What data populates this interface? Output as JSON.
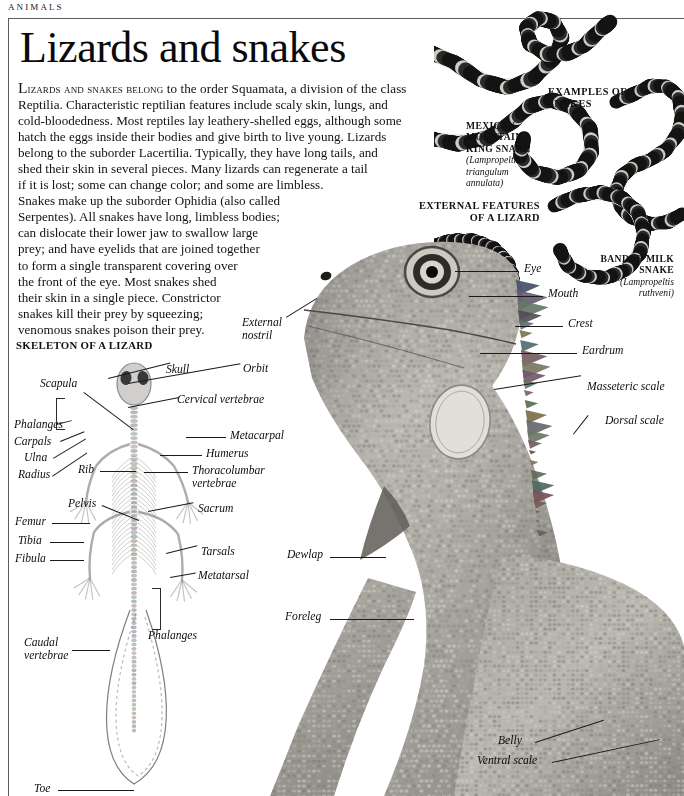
{
  "running_head": "ANIMALS",
  "title": "Lizards and snakes",
  "intro": {
    "lines": [
      "LIZARDS AND SNAKES BELONG to the order Squamata, a division of the class",
      "Reptilia. Characteristic reptilian features include scaly skin, lungs, and",
      "cold-bloodedness. Most reptiles lay leathery-shelled eggs, although some",
      "hatch the eggs inside their bodies and give birth to live young. Lizards",
      "belong to the suborder Lacertilia. Typically, they have long tails, and",
      "shed their skin in several pieces. Many lizards can regenerate a tail",
      "if it is lost; some can change color; and some are limbless.",
      "Snakes make up the suborder Ophidia (also called",
      "Serpentes). All snakes have long, limbless bodies;",
      "can dislocate their lower jaw to swallow large",
      "prey; and have eyelids that are joined together",
      "to form a single transparent covering over",
      "the front of the eye. Most snakes shed",
      "their skin in a single piece. Constrictor",
      "snakes kill their prey by squeezing;",
      "venomous snakes poison their prey."
    ],
    "small_caps_lead": "LIZARDS AND SNAKES BELONG"
  },
  "headings": {
    "examples_of_snakes": "EXAMPLES OF\nSNAKES",
    "examples_of_snakes_line1": "EXAMPLES OF",
    "examples_of_snakes_line2": "SNAKES",
    "external_features_line1": "EXTERNAL FEATURES",
    "external_features_line2": "OF A LIZARD",
    "skeleton_of_a_lizard": "SKELETON OF A LIZARD"
  },
  "snake_captions": [
    {
      "name_line1": "MEXICAN",
      "name_line2": "MOUNTAIN",
      "name_line3": "KING SNAKE",
      "latin_line1": "(Lampropeltis",
      "latin_line2": "triangulum",
      "latin_line3": "annulata)"
    },
    {
      "name_line1": "BANDED MILK",
      "name_line2": "SNAKE",
      "latin_line1": "(Lampropeltis",
      "latin_line2": "ruthveni)"
    }
  ],
  "lizard_labels": [
    {
      "id": "eye",
      "text": "Eye"
    },
    {
      "id": "mouth",
      "text": "Mouth"
    },
    {
      "id": "crest",
      "text": "Crest"
    },
    {
      "id": "eardrum",
      "text": "Eardrum"
    },
    {
      "id": "masseteric-scale",
      "text": "Masseteric scale"
    },
    {
      "id": "dorsal-scale",
      "text": "Dorsal scale"
    },
    {
      "id": "external-nostril-1",
      "text": "External"
    },
    {
      "id": "external-nostril-2",
      "text": "nostril"
    },
    {
      "id": "dewlap",
      "text": "Dewlap"
    },
    {
      "id": "foreleg",
      "text": "Foreleg"
    },
    {
      "id": "belly",
      "text": "Belly"
    },
    {
      "id": "ventral-scale",
      "text": "Ventral scale"
    }
  ],
  "skeleton_labels": [
    {
      "id": "skull",
      "text": "Skull"
    },
    {
      "id": "orbit",
      "text": "Orbit"
    },
    {
      "id": "scapula",
      "text": "Scapula"
    },
    {
      "id": "cervical-vertebrae",
      "text": "Cervical vertebrae"
    },
    {
      "id": "phalanges-front",
      "text": "Phalanges"
    },
    {
      "id": "carpals",
      "text": "Carpals"
    },
    {
      "id": "metacarpal",
      "text": "Metacarpal"
    },
    {
      "id": "ulna",
      "text": "Ulna"
    },
    {
      "id": "humerus",
      "text": "Humerus"
    },
    {
      "id": "radius",
      "text": "Radius"
    },
    {
      "id": "rib",
      "text": "Rib"
    },
    {
      "id": "thoracolumbar-1",
      "text": "Thoracolumbar"
    },
    {
      "id": "thoracolumbar-2",
      "text": "vertebrae"
    },
    {
      "id": "pelvis",
      "text": "Pelvis"
    },
    {
      "id": "sacrum",
      "text": "Sacrum"
    },
    {
      "id": "femur",
      "text": "Femur"
    },
    {
      "id": "tibia",
      "text": "Tibia"
    },
    {
      "id": "tarsals",
      "text": "Tarsals"
    },
    {
      "id": "fibula",
      "text": "Fibula"
    },
    {
      "id": "metatarsal",
      "text": "Metatarsal"
    },
    {
      "id": "phalanges-hind",
      "text": "Phalanges"
    },
    {
      "id": "caudal-1",
      "text": "Caudal"
    },
    {
      "id": "caudal-2",
      "text": "vertebrae"
    },
    {
      "id": "toe",
      "text": "Toe"
    }
  ],
  "colors": {
    "rule": "#5c5c5c",
    "text": "#111111",
    "leader": "#1a1a1a",
    "page_bg": "#ffffff"
  }
}
